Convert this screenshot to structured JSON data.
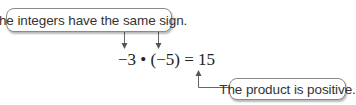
{
  "callouts": {
    "top": "The integers have the same sign.",
    "bottom": "The product is positive."
  },
  "equation": {
    "text": "−3 • (−5) = 15",
    "factor1": "−3",
    "operator": "•",
    "factor2": "(−5)",
    "result": "15"
  },
  "colors": {
    "arrow": "#555555",
    "border": "#8a8a8a",
    "text": "#333333"
  }
}
